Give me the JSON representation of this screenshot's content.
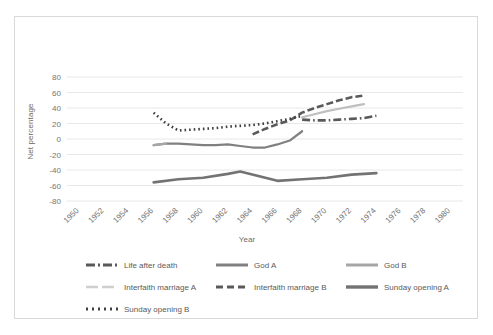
{
  "chart_data": {
    "type": "line",
    "title": "",
    "xlabel": "Year",
    "ylabel": "Net percentage",
    "xlim": [
      1949,
      1981
    ],
    "ylim": [
      -80,
      80
    ],
    "ytick_step": 20,
    "xtick_step": 2,
    "grid": "horizontal",
    "legend_position": "bottom",
    "yticks": [
      "80",
      "60",
      "40",
      "20",
      "0",
      "-20",
      "-40",
      "-60",
      "-80"
    ],
    "xticks": [
      "1950",
      "1952",
      "1954",
      "1956",
      "1958",
      "1960",
      "1962",
      "1964",
      "1966",
      "1968",
      "1970",
      "1972",
      "1974",
      "1976",
      "1978",
      "1980"
    ],
    "series": [
      {
        "name": "Life after death",
        "style": "dash-dot",
        "color": "#595959",
        "x": [
          1968,
          1969,
          1970,
          1971,
          1972,
          1973,
          1974
        ],
        "y": [
          25,
          24,
          24,
          25,
          26,
          27,
          30
        ]
      },
      {
        "name": "God A",
        "style": "solid",
        "color": "#808080",
        "x": [
          1956,
          1957,
          1958,
          1959,
          1960,
          1961,
          1962,
          1963,
          1964,
          1965,
          1966,
          1967,
          1968
        ],
        "y": [
          -8,
          -6,
          -6,
          -7,
          -8,
          -8,
          -7,
          -9,
          -11,
          -11,
          -7,
          -2,
          10
        ]
      },
      {
        "name": "God B",
        "style": "solid",
        "color": "#a6a6a6",
        "x": [
          1956,
          1957
        ],
        "y": [
          -8,
          -6
        ]
      },
      {
        "name": "Interfaith marriage A",
        "style": "solid-light",
        "color": "#bfbfbf",
        "x": [
          1968,
          1969,
          1970,
          1971,
          1972,
          1973
        ],
        "y": [
          28,
          32,
          36,
          39,
          42,
          45
        ]
      },
      {
        "name": "Interfaith marriage B",
        "style": "dashed",
        "color": "#5a5a5a",
        "x": [
          1964,
          1965,
          1966,
          1967,
          1968,
          1969,
          1970,
          1971,
          1972,
          1973
        ],
        "y": [
          6,
          13,
          19,
          24,
          34,
          40,
          45,
          50,
          54,
          56
        ]
      },
      {
        "name": "Sunday opening A",
        "style": "solid-thick",
        "color": "#737373",
        "x": [
          1956,
          1958,
          1960,
          1962,
          1963,
          1966,
          1968,
          1970,
          1972,
          1974
        ],
        "y": [
          -56,
          -52,
          -50,
          -45,
          -42,
          -54,
          -52,
          -50,
          -46,
          -44
        ]
      },
      {
        "name": "Sunday opening B",
        "style": "dotted",
        "color": "#404040",
        "x": [
          1956,
          1957,
          1958,
          1959,
          1960,
          1961,
          1962,
          1963,
          1964,
          1965,
          1966,
          1967,
          1968
        ],
        "y": [
          34,
          20,
          11,
          12,
          13,
          14,
          16,
          17,
          18,
          20,
          23,
          26,
          30
        ]
      }
    ]
  },
  "legend": {
    "rows": [
      [
        {
          "label": "Life after death",
          "swatch": "dash-dot-swatch"
        },
        {
          "label": "God A",
          "swatch": "solid-swatch"
        },
        {
          "label": "God B",
          "swatch": "solid-light-swatch"
        }
      ],
      [
        {
          "label": "Interfaith marriage A",
          "swatch": "solid-lightest-swatch"
        },
        {
          "label": "Interfaith marriage B",
          "swatch": "dashed-swatch"
        },
        {
          "label": "Sunday opening A",
          "swatch": "solid-thick-swatch"
        }
      ],
      [
        {
          "label": "Sunday opening B",
          "swatch": "dotted-swatch"
        }
      ]
    ]
  },
  "axes": {
    "x_title": "Year",
    "y_title": "Net percentage"
  },
  "colors": {
    "grid": "#e8e8e8",
    "text": "#757575",
    "card_border": "#d9d9d9",
    "background": "#ffffff"
  }
}
